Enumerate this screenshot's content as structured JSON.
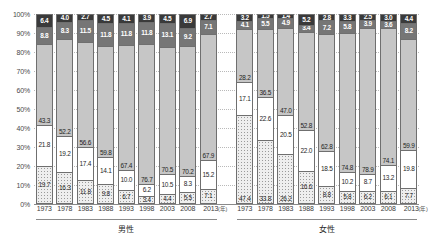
{
  "chart_data": {
    "type": "bar",
    "subtype": "100% stacked bar",
    "title": "",
    "xlabel": "",
    "ylabel": "",
    "ylim": [
      0,
      100
    ],
    "yticks": [
      "0%",
      "10%",
      "20%",
      "30%",
      "40%",
      "50%",
      "60%",
      "70%",
      "80%",
      "90%",
      "100%"
    ],
    "grid": true,
    "legend_position": "none",
    "x_unit": "(年)",
    "categories": [
      "1973",
      "1978",
      "1983",
      "1988",
      "1993",
      "1998",
      "2003",
      "2008",
      "2013"
    ],
    "groups": [
      {
        "name": "男性",
        "bars": [
          {
            "x": "1973",
            "segments": [
              {
                "style": "dark",
                "value": "6.4"
              },
              {
                "style": "mid",
                "value": "8.8"
              },
              {
                "style": "light",
                "value": "43.3"
              },
              {
                "style": "white",
                "value": "21.8"
              },
              {
                "style": "dot",
                "value": "19.7"
              }
            ]
          },
          {
            "x": "1978",
            "segments": [
              {
                "style": "dark",
                "value": "4.0"
              },
              {
                "style": "mid",
                "value": "8.3"
              },
              {
                "style": "light",
                "value": "52.2"
              },
              {
                "style": "white",
                "value": "19.2"
              },
              {
                "style": "dot",
                "value": "16.3"
              }
            ]
          },
          {
            "x": "1983",
            "segments": [
              {
                "style": "dark",
                "value": "2.7"
              },
              {
                "style": "mid",
                "value": "11.5"
              },
              {
                "style": "light",
                "value": "56.6"
              },
              {
                "style": "white",
                "value": "17.4"
              },
              {
                "style": "dot",
                "value": "11.8"
              }
            ]
          },
          {
            "x": "1988",
            "segments": [
              {
                "style": "dark",
                "value": "4.5"
              },
              {
                "style": "mid",
                "value": "11.8"
              },
              {
                "style": "light",
                "value": "59.8"
              },
              {
                "style": "white",
                "value": "14.1"
              },
              {
                "style": "dot",
                "value": "9.8"
              }
            ]
          },
          {
            "x": "1993",
            "segments": [
              {
                "style": "dark",
                "value": "4.1"
              },
              {
                "style": "mid",
                "value": "11.8"
              },
              {
                "style": "light",
                "value": "67.4"
              },
              {
                "style": "white",
                "value": "10.0"
              },
              {
                "style": "dot",
                "value": "6.7"
              }
            ]
          },
          {
            "x": "1998",
            "segments": [
              {
                "style": "dark",
                "value": "3.9"
              },
              {
                "style": "mid",
                "value": "11.8"
              },
              {
                "style": "light",
                "value": "76.7"
              },
              {
                "style": "white",
                "value": "6.2"
              },
              {
                "style": "dot",
                "value": "3.4"
              }
            ]
          },
          {
            "x": "2003",
            "segments": [
              {
                "style": "dark",
                "value": "4.5"
              },
              {
                "style": "mid",
                "value": "13.1"
              },
              {
                "style": "light",
                "value": "70.5"
              },
              {
                "style": "white",
                "value": "10.5"
              },
              {
                "style": "dot",
                "value": "4.4"
              }
            ]
          },
          {
            "x": "2008",
            "segments": [
              {
                "style": "dark",
                "value": "6.9"
              },
              {
                "style": "mid",
                "value": "9.2"
              },
              {
                "style": "light",
                "value": "70.2"
              },
              {
                "style": "white",
                "value": "8.3"
              },
              {
                "style": "dot",
                "value": "5.5"
              }
            ]
          },
          {
            "x": "2013",
            "segments": [
              {
                "style": "dark",
                "value": "2.7"
              },
              {
                "style": "mid",
                "value": "7.1"
              },
              {
                "style": "light",
                "value": "67.9"
              },
              {
                "style": "white",
                "value": "15.2"
              },
              {
                "style": "dot",
                "value": "7.1"
              }
            ]
          }
        ]
      },
      {
        "name": "女性",
        "bars": [
          {
            "x": "1973",
            "segments": [
              {
                "style": "dark",
                "value": "3.2"
              },
              {
                "style": "mid",
                "value": "4.1"
              },
              {
                "style": "light",
                "value": "28.2"
              },
              {
                "style": "white",
                "value": "17.1"
              },
              {
                "style": "dot",
                "value": "47.4"
              }
            ]
          },
          {
            "x": "1978",
            "segments": [
              {
                "style": "dark",
                "value": "1.5"
              },
              {
                "style": "mid",
                "value": "5.5"
              },
              {
                "style": "light",
                "value": "36.5"
              },
              {
                "style": "white",
                "value": "22.6"
              },
              {
                "style": "dot",
                "value": "33.8"
              }
            ]
          },
          {
            "x": "1983",
            "segments": [
              {
                "style": "dark",
                "value": "1.4"
              },
              {
                "style": "mid",
                "value": "4.9"
              },
              {
                "style": "light",
                "value": "47.0"
              },
              {
                "style": "white",
                "value": "20.5"
              },
              {
                "style": "dot",
                "value": "26.2"
              }
            ]
          },
          {
            "x": "1988",
            "segments": [
              {
                "style": "dark",
                "value": "5.2"
              },
              {
                "style": "mid",
                "value": "3.4"
              },
              {
                "style": "light",
                "value": "52.8"
              },
              {
                "style": "white",
                "value": "22.0"
              },
              {
                "style": "dot",
                "value": "16.6"
              }
            ]
          },
          {
            "x": "1993",
            "segments": [
              {
                "style": "dark",
                "value": "2.8"
              },
              {
                "style": "mid",
                "value": "7.2"
              },
              {
                "style": "light",
                "value": "62.8"
              },
              {
                "style": "white",
                "value": "18.5"
              },
              {
                "style": "dot",
                "value": "8.8"
              }
            ]
          },
          {
            "x": "1998",
            "segments": [
              {
                "style": "dark",
                "value": "3.3"
              },
              {
                "style": "mid",
                "value": "5.8"
              },
              {
                "style": "light",
                "value": "74.8"
              },
              {
                "style": "white",
                "value": "10.2"
              },
              {
                "style": "dot",
                "value": "5.8"
              }
            ]
          },
          {
            "x": "2003",
            "segments": [
              {
                "style": "dark",
                "value": "2.5"
              },
              {
                "style": "mid",
                "value": "3.9"
              },
              {
                "style": "light",
                "value": "78.9"
              },
              {
                "style": "white",
                "value": "8.7"
              },
              {
                "style": "dot",
                "value": "6.2"
              }
            ]
          },
          {
            "x": "2008",
            "segments": [
              {
                "style": "dark",
                "value": "3.0"
              },
              {
                "style": "mid",
                "value": "3.6"
              },
              {
                "style": "light",
                "value": "74.1"
              },
              {
                "style": "white",
                "value": "13.2"
              },
              {
                "style": "dot",
                "value": "6.1"
              }
            ]
          },
          {
            "x": "2013",
            "segments": [
              {
                "style": "dark",
                "value": "4.4"
              },
              {
                "style": "mid",
                "value": "8.2"
              },
              {
                "style": "light",
                "value": "59.9"
              },
              {
                "style": "white",
                "value": "19.8"
              },
              {
                "style": "dot",
                "value": "7.7"
              }
            ]
          }
        ]
      }
    ],
    "colors": {
      "dark": "#3a3a3a",
      "mid": "#767676",
      "light": "#c6c6c6",
      "white": "#ffffff",
      "dot": "#eeeeee",
      "axis": "#8a8a8a",
      "grid": "#b9b9b9"
    }
  }
}
